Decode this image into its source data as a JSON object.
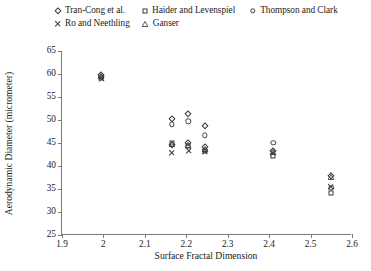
{
  "chart_data": {
    "type": "scatter",
    "title": "",
    "xlabel": "Surface Fractal Dimension",
    "ylabel": "Aerodynamic Diameter (micrometer)",
    "xlim": [
      1.9,
      2.6
    ],
    "ylim": [
      25,
      65
    ],
    "xticks": [
      "1.9",
      "2",
      "2.1",
      "2.2",
      "2.3",
      "2.4",
      "2.5",
      "2.6"
    ],
    "xtick_values": [
      1.9,
      2.0,
      2.1,
      2.2,
      2.3,
      2.4,
      2.5,
      2.6
    ],
    "yticks": [
      "25",
      "30",
      "35",
      "40",
      "45",
      "50",
      "55",
      "60",
      "65"
    ],
    "ytick_values": [
      25,
      30,
      35,
      40,
      45,
      50,
      55,
      60,
      65
    ],
    "grid": false,
    "legend_position": "above-plot",
    "series": [
      {
        "name": "Tran-Cong et al.",
        "marker": "diamond",
        "points": [
          {
            "x": 1.995,
            "y": 59.8
          },
          {
            "x": 2.165,
            "y": 50.2
          },
          {
            "x": 2.205,
            "y": 51.3
          },
          {
            "x": 2.245,
            "y": 48.6
          },
          {
            "x": 2.165,
            "y": 44.6
          },
          {
            "x": 2.205,
            "y": 44.9
          },
          {
            "x": 2.245,
            "y": 44.1
          },
          {
            "x": 2.41,
            "y": 43.3
          },
          {
            "x": 2.55,
            "y": 37.8
          }
        ]
      },
      {
        "name": "Haider and Levenspiel",
        "marker": "square",
        "points": [
          {
            "x": 1.995,
            "y": 59.2
          },
          {
            "x": 2.165,
            "y": 44.9
          },
          {
            "x": 2.205,
            "y": 44.4
          },
          {
            "x": 2.245,
            "y": 43.2
          },
          {
            "x": 2.41,
            "y": 42.2
          },
          {
            "x": 2.55,
            "y": 34.2
          }
        ]
      },
      {
        "name": "Thompson and Clark",
        "marker": "circle",
        "points": [
          {
            "x": 1.995,
            "y": 59.4
          },
          {
            "x": 2.165,
            "y": 49.1
          },
          {
            "x": 2.205,
            "y": 49.7
          },
          {
            "x": 2.245,
            "y": 46.7
          },
          {
            "x": 2.41,
            "y": 45.0
          },
          {
            "x": 2.55,
            "y": 35.3
          }
        ]
      },
      {
        "name": "Ro and Neethling",
        "marker": "cross",
        "points": [
          {
            "x": 1.995,
            "y": 58.9
          },
          {
            "x": 2.165,
            "y": 42.9
          },
          {
            "x": 2.205,
            "y": 43.2
          },
          {
            "x": 2.245,
            "y": 43.0
          },
          {
            "x": 2.41,
            "y": 42.8
          },
          {
            "x": 2.55,
            "y": 35.5
          }
        ]
      },
      {
        "name": "Ganser",
        "marker": "triangle",
        "points": [
          {
            "x": 1.995,
            "y": 59.5
          },
          {
            "x": 2.165,
            "y": 44.7
          },
          {
            "x": 2.205,
            "y": 44.6
          },
          {
            "x": 2.245,
            "y": 43.6
          },
          {
            "x": 2.41,
            "y": 43.0
          },
          {
            "x": 2.55,
            "y": 37.6
          }
        ]
      }
    ]
  },
  "legend": {
    "rows": [
      [
        "Tran-Cong et al.",
        "Haider and Levenspiel",
        "Thompson and Clark"
      ],
      [
        "Ro and Neethling",
        "Ganser"
      ]
    ]
  },
  "colors": {
    "marker": "#3b3b3b",
    "axis": "#7a7a7a",
    "text": "#1a1a1a",
    "background": "#ffffff"
  }
}
